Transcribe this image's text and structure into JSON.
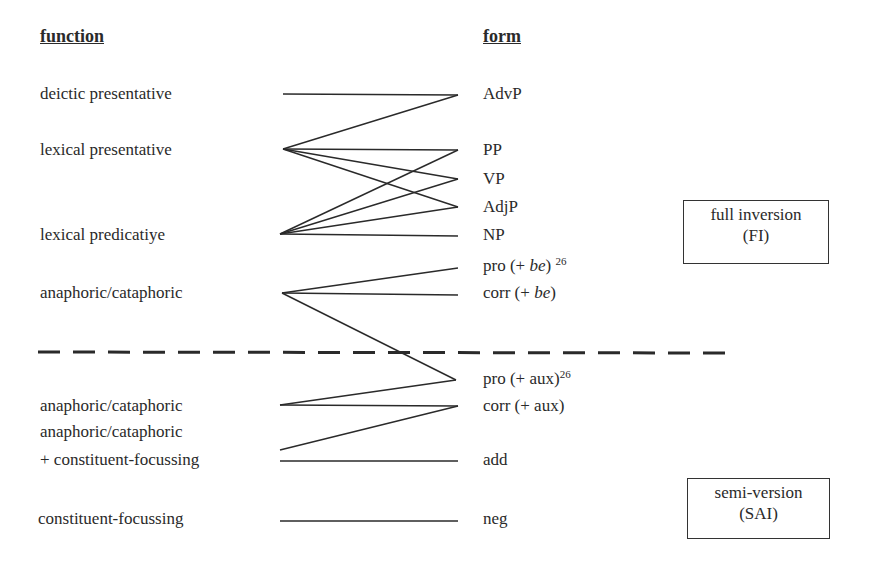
{
  "headers": {
    "function": "function",
    "form": "form"
  },
  "functions": [
    {
      "label": "deictic presentative"
    },
    {
      "label": "lexical presentative"
    },
    {
      "label": "lexical predicatiye"
    },
    {
      "label": "anaphoric/cataphoric"
    },
    {
      "label": "anaphoric/cataphoric"
    },
    {
      "label": "anaphoric/cataphoric"
    },
    {
      "label": "+ constituent-focussing"
    },
    {
      "label": "constituent-focussing"
    }
  ],
  "forms": [
    {
      "label": "AdvP"
    },
    {
      "label": "PP"
    },
    {
      "label": "VP"
    },
    {
      "label": "AdjP"
    },
    {
      "label": "NP"
    },
    {
      "pre": "pro (+ ",
      "italic": "be",
      "post": ")",
      "sup": "26"
    },
    {
      "pre": "corr (+ ",
      "italic": "be",
      "post": ")"
    },
    {
      "pre": "pro (+ aux)",
      "sup": "26"
    },
    {
      "label": "corr (+ aux)"
    },
    {
      "label": "add"
    },
    {
      "label": "neg"
    }
  ],
  "boxes": {
    "fi": {
      "line1": "full inversion",
      "line2": "(FI)"
    },
    "sai": {
      "line1": "semi-version",
      "line2": "(SAI)"
    }
  },
  "connections": [
    [
      "deictic presentative",
      "AdvP"
    ],
    [
      "lexical presentative",
      "AdvP"
    ],
    [
      "lexical presentative",
      "PP"
    ],
    [
      "lexical presentative",
      "VP"
    ],
    [
      "lexical presentative",
      "AdjP"
    ],
    [
      "lexical predicative",
      "PP"
    ],
    [
      "lexical predicative",
      "VP"
    ],
    [
      "lexical predicative",
      "AdjP"
    ],
    [
      "lexical predicative",
      "NP"
    ],
    [
      "anaphoric/cataphoric",
      "pro (+ be)"
    ],
    [
      "anaphoric/cataphoric",
      "corr (+ be)"
    ],
    [
      "anaphoric/cataphoric",
      "pro (+ aux)"
    ],
    [
      "anaphoric/cataphoric (SAI)",
      "pro (+ aux)"
    ],
    [
      "anaphoric/cataphoric (SAI)",
      "corr (+ aux)"
    ],
    [
      "anaphoric/cataphoric + constituent-focussing",
      "corr (+ aux)"
    ],
    [
      "anaphoric/cataphoric + constituent-focussing",
      "add"
    ],
    [
      "constituent-focussing",
      "neg"
    ]
  ],
  "colors": {
    "ink": "#2a2a2a",
    "background": "#ffffff"
  }
}
